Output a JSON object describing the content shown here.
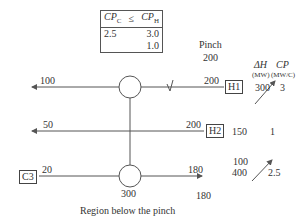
{
  "table": {
    "header": {
      "left": "CP",
      "left_sub": "C",
      "op": "≤",
      "right": "CP",
      "right_sub": "H"
    },
    "rows": [
      {
        "left": "2.5",
        "right": "3.0"
      },
      {
        "left": "",
        "right": "1.0"
      }
    ]
  },
  "pinch": {
    "label": "Pinch",
    "value": "200"
  },
  "columns": {
    "dh": {
      "label": "ΔH",
      "unit": "(MW)"
    },
    "cp": {
      "label": "CP",
      "unit": "(MW/C)"
    }
  },
  "streams": [
    {
      "name": "H1",
      "t_in": "200",
      "t_out": "100",
      "dh": "300",
      "cp": "3"
    },
    {
      "name": "H2",
      "t_in": "200",
      "t_out": "50",
      "dh": "150",
      "cp": "1"
    },
    {
      "name": "C3",
      "t_in": "20",
      "t_out": "180",
      "dh_old": "400",
      "dh_new": "100",
      "cp": "2.5"
    }
  ],
  "exchanger": {
    "duty": "300"
  },
  "c3_target": "180",
  "caption": "Region below the pinch",
  "colors": {
    "line": "#555555",
    "text": "#333333"
  }
}
